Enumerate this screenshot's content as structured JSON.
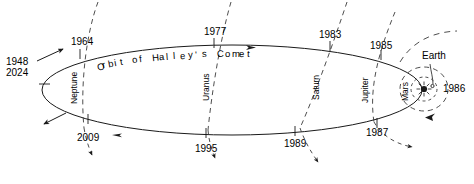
{
  "figure": {
    "caption_label": "Orbit of Halley's Comet",
    "background_color": "#ffffff",
    "line_color": "#1a1a1a",
    "text_color": "#000000"
  },
  "comet_orbit": {
    "name": "Halley's Comet orbit",
    "shape": "ellipse",
    "direction_note": "arrows indicate direction of travel"
  },
  "year_markers": [
    {
      "id": "aphelion",
      "label_lines": [
        "1948",
        "2024"
      ],
      "x": 6,
      "y": 58,
      "tick_x": 46,
      "tick_y": 71
    },
    {
      "id": "y1964",
      "label": "1964",
      "x": 71,
      "y": 37,
      "tick_x": 81,
      "tick_y": 54
    },
    {
      "id": "y1977",
      "label": "1977",
      "x": 205,
      "y": 27,
      "tick_x": 214,
      "tick_y": 42
    },
    {
      "id": "y1983",
      "label": "1983",
      "x": 320,
      "y": 30,
      "tick_x": 330,
      "tick_y": 46
    },
    {
      "id": "y1985",
      "label": "1985",
      "x": 371,
      "y": 41,
      "tick_x": 381,
      "tick_y": 55
    },
    {
      "id": "y1986",
      "label": "1986",
      "x": 443,
      "y": 85,
      "tick_x": 438,
      "tick_y": 90
    },
    {
      "id": "y1987",
      "label": "1987",
      "x": 367,
      "y": 128,
      "tick_x": 377,
      "tick_y": 124
    },
    {
      "id": "y1989",
      "label": "1989",
      "x": 285,
      "y": 139,
      "tick_x": 295,
      "tick_y": 131
    },
    {
      "id": "y1995",
      "label": "1995",
      "x": 196,
      "y": 144,
      "tick_x": 206,
      "tick_y": 133
    },
    {
      "id": "y2009",
      "label": "2009",
      "x": 78,
      "y": 133,
      "tick_x": 88,
      "tick_y": 119
    }
  ],
  "planet_orbits": [
    {
      "id": "neptune",
      "label": "Neptune",
      "x": 69,
      "y": 64
    },
    {
      "id": "uranus",
      "label": "Uranus",
      "x": 205,
      "y": 63
    },
    {
      "id": "saturn",
      "label": "Saturn",
      "x": 315,
      "y": 62
    },
    {
      "id": "jupiter",
      "label": "Jupiter",
      "x": 364,
      "y": 64
    },
    {
      "id": "mars",
      "label": "Mars",
      "x": 404,
      "y": 67
    }
  ],
  "bodies": [
    {
      "id": "sun",
      "label": "",
      "glyph": "sun-symbol",
      "x": 424,
      "y": 88
    },
    {
      "id": "earth",
      "label": "Earth",
      "x": 423,
      "y": 57
    }
  ],
  "leader_lines": [
    {
      "from": "earth-label",
      "to": "earth-orbit"
    }
  ]
}
